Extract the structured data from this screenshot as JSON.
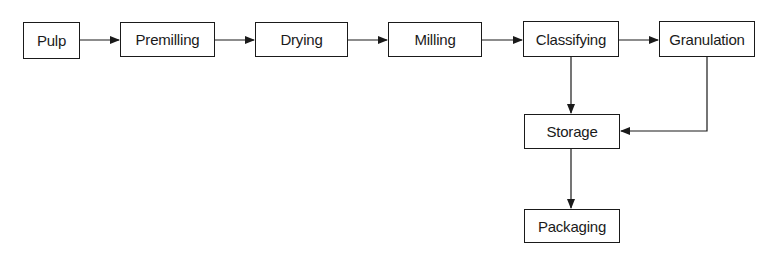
{
  "diagram": {
    "type": "process-flowchart",
    "nodes": [
      {
        "id": "pulp",
        "label": "Pulp"
      },
      {
        "id": "premilling",
        "label": "Premilling"
      },
      {
        "id": "drying",
        "label": "Drying"
      },
      {
        "id": "milling",
        "label": "Milling"
      },
      {
        "id": "classifying",
        "label": "Classifying"
      },
      {
        "id": "granulation",
        "label": "Granulation"
      },
      {
        "id": "storage",
        "label": "Storage"
      },
      {
        "id": "packaging",
        "label": "Packaging"
      }
    ],
    "edges": [
      {
        "from": "pulp",
        "to": "premilling"
      },
      {
        "from": "premilling",
        "to": "drying"
      },
      {
        "from": "drying",
        "to": "milling"
      },
      {
        "from": "milling",
        "to": "classifying"
      },
      {
        "from": "classifying",
        "to": "granulation"
      },
      {
        "from": "classifying",
        "to": "storage"
      },
      {
        "from": "granulation",
        "to": "storage"
      },
      {
        "from": "storage",
        "to": "packaging"
      }
    ],
    "colors": {
      "stroke": "#1a1a1a",
      "background": "#ffffff"
    }
  }
}
